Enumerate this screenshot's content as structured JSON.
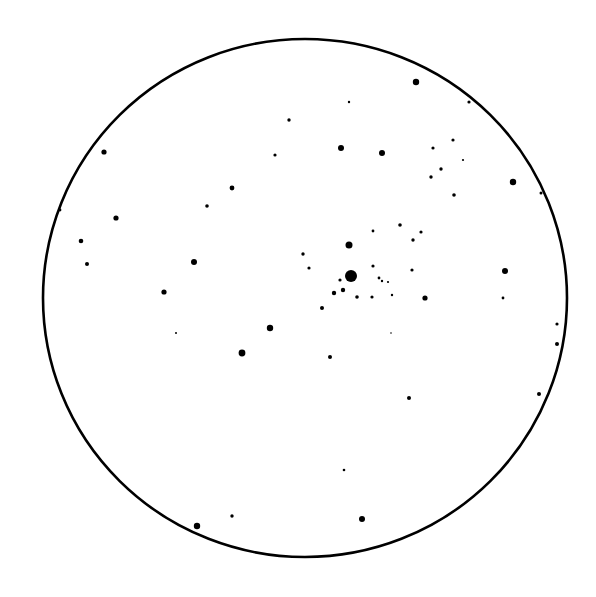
{
  "figure": {
    "background": "#ffffff",
    "ink": "#000000",
    "field_circle": {
      "cx": 305,
      "cy": 298,
      "rx": 262,
      "ry": 259
    }
  },
  "stars": [
    {
      "x": 351,
      "y": 276,
      "r": 6
    },
    {
      "x": 349,
      "y": 245,
      "r": 3.5
    },
    {
      "x": 343,
      "y": 290,
      "r": 2.2
    },
    {
      "x": 334,
      "y": 293,
      "r": 2.2
    },
    {
      "x": 340,
      "y": 280,
      "r": 1.6
    },
    {
      "x": 373,
      "y": 266,
      "r": 1.6
    },
    {
      "x": 373,
      "y": 231,
      "r": 1.4
    },
    {
      "x": 379,
      "y": 278,
      "r": 1.4
    },
    {
      "x": 382,
      "y": 281,
      "r": 1.2
    },
    {
      "x": 388,
      "y": 282,
      "r": 1.1
    },
    {
      "x": 372,
      "y": 297,
      "r": 1.6
    },
    {
      "x": 357,
      "y": 297,
      "r": 1.8
    },
    {
      "x": 392,
      "y": 295,
      "r": 1.2
    },
    {
      "x": 400,
      "y": 225,
      "r": 1.8
    },
    {
      "x": 421,
      "y": 232,
      "r": 1.6
    },
    {
      "x": 413,
      "y": 240,
      "r": 1.7
    },
    {
      "x": 412,
      "y": 270,
      "r": 1.6
    },
    {
      "x": 425,
      "y": 298,
      "r": 2.6
    },
    {
      "x": 322,
      "y": 308,
      "r": 2.0
    },
    {
      "x": 303,
      "y": 254,
      "r": 1.7
    },
    {
      "x": 309,
      "y": 268,
      "r": 1.6
    },
    {
      "x": 416,
      "y": 82,
      "r": 3.2
    },
    {
      "x": 469,
      "y": 102,
      "r": 1.6
    },
    {
      "x": 349,
      "y": 102,
      "r": 1.2
    },
    {
      "x": 433,
      "y": 148,
      "r": 1.6
    },
    {
      "x": 453,
      "y": 140,
      "r": 1.6
    },
    {
      "x": 441,
      "y": 169,
      "r": 1.7
    },
    {
      "x": 431,
      "y": 177,
      "r": 1.7
    },
    {
      "x": 463,
      "y": 160,
      "r": 1.1
    },
    {
      "x": 454,
      "y": 195,
      "r": 1.8
    },
    {
      "x": 513,
      "y": 182,
      "r": 3.2
    },
    {
      "x": 541,
      "y": 193,
      "r": 1.5
    },
    {
      "x": 341,
      "y": 148,
      "r": 3.0
    },
    {
      "x": 382,
      "y": 153,
      "r": 3.0
    },
    {
      "x": 289,
      "y": 120,
      "r": 1.7
    },
    {
      "x": 275,
      "y": 155,
      "r": 1.6
    },
    {
      "x": 232,
      "y": 188,
      "r": 2.4
    },
    {
      "x": 207,
      "y": 206,
      "r": 1.8
    },
    {
      "x": 104,
      "y": 152,
      "r": 2.6
    },
    {
      "x": 60,
      "y": 210,
      "r": 1.4
    },
    {
      "x": 116,
      "y": 218,
      "r": 2.6
    },
    {
      "x": 81,
      "y": 241,
      "r": 2.3
    },
    {
      "x": 87,
      "y": 264,
      "r": 2.0
    },
    {
      "x": 194,
      "y": 262,
      "r": 3.0
    },
    {
      "x": 164,
      "y": 292,
      "r": 2.6
    },
    {
      "x": 505,
      "y": 271,
      "r": 3.0
    },
    {
      "x": 503,
      "y": 298,
      "r": 1.4
    },
    {
      "x": 176,
      "y": 333,
      "r": 1.0
    },
    {
      "x": 270,
      "y": 328,
      "r": 3.2
    },
    {
      "x": 242,
      "y": 353,
      "r": 3.4
    },
    {
      "x": 330,
      "y": 357,
      "r": 2.0
    },
    {
      "x": 391,
      "y": 333,
      "r": 0.8
    },
    {
      "x": 557,
      "y": 324,
      "r": 1.6
    },
    {
      "x": 557,
      "y": 344,
      "r": 2.0
    },
    {
      "x": 409,
      "y": 398,
      "r": 2.0
    },
    {
      "x": 539,
      "y": 394,
      "r": 2.0
    },
    {
      "x": 344,
      "y": 470,
      "r": 1.3
    },
    {
      "x": 197,
      "y": 526,
      "r": 3.2
    },
    {
      "x": 232,
      "y": 516,
      "r": 1.7
    },
    {
      "x": 362,
      "y": 519,
      "r": 3.0
    }
  ]
}
